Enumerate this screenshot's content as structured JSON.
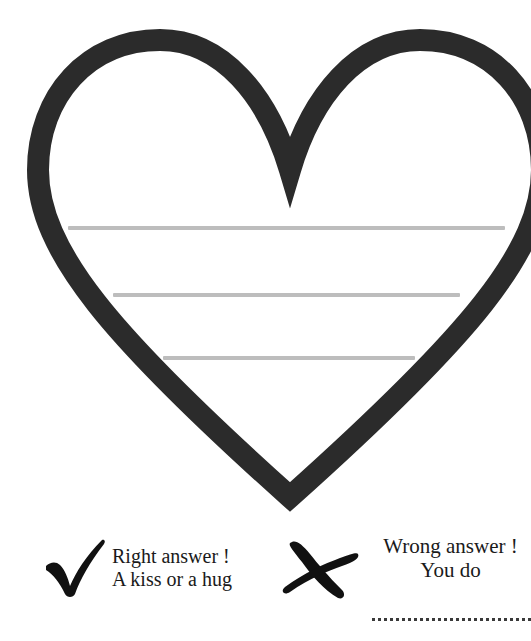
{
  "page": {
    "background_color": "#ffffff",
    "width": 531,
    "height": 641
  },
  "heart": {
    "name": "heart-outline",
    "stroke_color": "#2b2b2b",
    "fill_color": "#ffffff",
    "stroke_width": 22,
    "writing_lines": [
      {
        "label": "writing-line-1",
        "color": "#bdbdbd"
      },
      {
        "label": "writing-line-2",
        "color": "#bdbdbd"
      },
      {
        "label": "writing-line-3",
        "color": "#bdbdbd"
      }
    ]
  },
  "footer": {
    "right_answer": {
      "icon": "check-mark-icon",
      "icon_color": "#111111",
      "line_1": "Right answer !",
      "line_2": "A kiss or a hug"
    },
    "wrong_answer": {
      "icon": "cross-mark-icon",
      "icon_color": "#111111",
      "line_1": "Wrong answer !",
      "line_2": "You do",
      "dotted_line_color": "#3a3a3a"
    }
  }
}
